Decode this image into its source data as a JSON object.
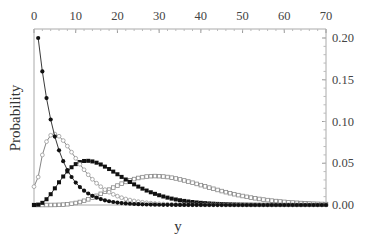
{
  "chart_data": {
    "type": "line",
    "title": "",
    "xlabel": "y",
    "ylabel": "Probability",
    "xlim": [
      0,
      70
    ],
    "ylim": [
      0,
      0.2
    ],
    "x_ticks": [
      "0",
      "10",
      "20",
      "30",
      "40",
      "50",
      "60",
      "70"
    ],
    "y_ticks": [
      "0.00",
      "0.05",
      "0.10",
      "0.15",
      "0.20"
    ],
    "x_axis_position": "top",
    "y_axis_position": "right",
    "grid": false,
    "legend": null,
    "series": [
      {
        "name": "series-1-filled-circles",
        "marker": "filled-circle",
        "color": "#111111",
        "shape": "geometric-decay",
        "params": {
          "p": 0.2,
          "start": 1
        },
        "key_points": {
          "x": [
            1,
            2,
            3,
            4,
            5,
            10,
            20,
            30
          ],
          "y": [
            0.2,
            0.16,
            0.128,
            0.102,
            0.082,
            0.027,
            0.003,
            0.0
          ]
        }
      },
      {
        "name": "series-2-open-circles",
        "marker": "open-circle",
        "color": "#888888",
        "shape": "gamma",
        "params": {
          "a": 2.2,
          "theta": 4.0,
          "y0": 0.022
        },
        "key_points": {
          "x": [
            0,
            2,
            5,
            10,
            20,
            30,
            40
          ],
          "y": [
            0.022,
            0.064,
            0.084,
            0.063,
            0.018,
            0.004,
            0.001
          ]
        }
      },
      {
        "name": "series-3-filled-squares",
        "marker": "filled-square",
        "color": "#111111",
        "shape": "gamma",
        "params": {
          "a": 4.0,
          "theta": 4.23
        },
        "key_points": {
          "x": [
            0,
            5,
            13,
            20,
            30,
            40,
            50
          ],
          "y": [
            0.0,
            0.03,
            0.053,
            0.042,
            0.018,
            0.006,
            0.002
          ]
        }
      },
      {
        "name": "series-4-open-squares",
        "marker": "open-square",
        "color": "#888888",
        "shape": "gamma",
        "params": {
          "a": 7.5,
          "theta": 4.46
        },
        "key_points": {
          "x": [
            0,
            10,
            20,
            29,
            40,
            50,
            60,
            70
          ],
          "y": [
            0.0,
            0.004,
            0.022,
            0.035,
            0.026,
            0.012,
            0.004,
            0.001
          ]
        }
      }
    ]
  },
  "axes": {
    "xlabel": "y",
    "ylabel": "Probability"
  }
}
